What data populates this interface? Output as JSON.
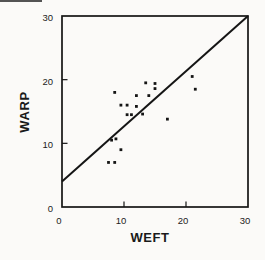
{
  "figure": {
    "background": "#fbfaf8",
    "ink_color": "#151515"
  },
  "chart_data": {
    "type": "scatter",
    "title": "",
    "xlabel": "WEFT",
    "ylabel": "WARP",
    "xlim": [
      0,
      30
    ],
    "ylim": [
      0,
      30
    ],
    "x_ticks": [
      0,
      10,
      20,
      30
    ],
    "y_ticks": [
      0,
      10,
      20,
      30
    ],
    "grid": false,
    "legend": null,
    "marker": "small-black-square",
    "points": [
      {
        "x": 7.5,
        "y": 7
      },
      {
        "x": 8.5,
        "y": 7
      },
      {
        "x": 9.5,
        "y": 9
      },
      {
        "x": 8.0,
        "y": 10.5
      },
      {
        "x": 8.7,
        "y": 10.7
      },
      {
        "x": 10.5,
        "y": 14.5
      },
      {
        "x": 11.2,
        "y": 14.5
      },
      {
        "x": 13.0,
        "y": 14.6
      },
      {
        "x": 9.5,
        "y": 16
      },
      {
        "x": 10.5,
        "y": 16
      },
      {
        "x": 12.0,
        "y": 15.8
      },
      {
        "x": 12.0,
        "y": 17.5
      },
      {
        "x": 14.0,
        "y": 17.5
      },
      {
        "x": 8.5,
        "y": 18
      },
      {
        "x": 13.5,
        "y": 19.5
      },
      {
        "x": 15.0,
        "y": 19.4
      },
      {
        "x": 15.0,
        "y": 18.6
      },
      {
        "x": 17.0,
        "y": 13.8
      },
      {
        "x": 21.0,
        "y": 20.5
      },
      {
        "x": 21.5,
        "y": 18.5
      }
    ],
    "fit_line": {
      "x_start": 0,
      "y_start": 4,
      "x_end": 30,
      "y_end": 30
    }
  }
}
